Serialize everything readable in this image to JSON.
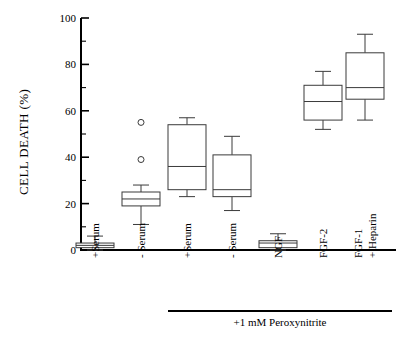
{
  "chart_data": {
    "type": "box",
    "title": "",
    "xlabel": "",
    "ylabel": "CELL DEATH (%)",
    "ylim": [
      0,
      100
    ],
    "ytick_labels": [
      "0",
      "20",
      "40",
      "60",
      "80",
      "100"
    ],
    "ytick_values": [
      0,
      20,
      40,
      60,
      80,
      100
    ],
    "yminor_step": 10,
    "grid": false,
    "legend": "none",
    "categories": [
      "+Serum",
      "- Serum",
      "+Serum",
      "- Serum",
      "NGF",
      "FGF-2",
      "FGF-1\n+ Heparin"
    ],
    "group_annotation": {
      "label": "+1 mM Peroxynitrite",
      "covers_categories": [
        2,
        3,
        4,
        5,
        6
      ]
    },
    "boxes": [
      {
        "category": "+Serum",
        "whisker_low": 0,
        "q1": 1,
        "median": 2,
        "q3": 3,
        "whisker_high": 6,
        "outliers": []
      },
      {
        "category": "- Serum",
        "whisker_low": 11,
        "q1": 19,
        "median": 22,
        "q3": 25,
        "whisker_high": 28,
        "outliers": [
          39,
          55
        ]
      },
      {
        "category": "+Serum",
        "whisker_low": 23,
        "q1": 26,
        "median": 36,
        "q3": 54,
        "whisker_high": 57,
        "outliers": []
      },
      {
        "category": "- Serum",
        "whisker_low": 17,
        "q1": 23,
        "median": 26,
        "q3": 41,
        "whisker_high": 49,
        "outliers": []
      },
      {
        "category": "NGF",
        "whisker_low": 0,
        "q1": 1,
        "median": 3,
        "q3": 4,
        "whisker_high": 7,
        "outliers": []
      },
      {
        "category": "FGF-2",
        "whisker_low": 52,
        "q1": 56,
        "median": 64,
        "q3": 71,
        "whisker_high": 77,
        "outliers": []
      },
      {
        "category": "FGF-1 + Heparin",
        "whisker_low": 56,
        "q1": 65,
        "median": 70,
        "q3": 85,
        "whisker_high": 93,
        "outliers": []
      }
    ]
  },
  "axis": {
    "y_title": "CELL DEATH (%)"
  },
  "category_labels": [
    {
      "line1": "+Serum",
      "line2": ""
    },
    {
      "line1": "- Serum",
      "line2": ""
    },
    {
      "line1": "+Serum",
      "line2": ""
    },
    {
      "line1": "- Serum",
      "line2": ""
    },
    {
      "line1": "NGF",
      "line2": ""
    },
    {
      "line1": "FGF-2",
      "line2": ""
    },
    {
      "line1": "FGF-1",
      "line2": "+ Heparin"
    }
  ],
  "group_bracket": {
    "label": "+1 mM Peroxynitrite"
  },
  "ytick_labels": [
    "100",
    "80",
    "60",
    "40",
    "20",
    "0"
  ],
  "colors": {
    "axis": "#000000",
    "box_stroke": "#3a3a3a",
    "box_fill": "#ffffff",
    "background": "#ffffff"
  }
}
